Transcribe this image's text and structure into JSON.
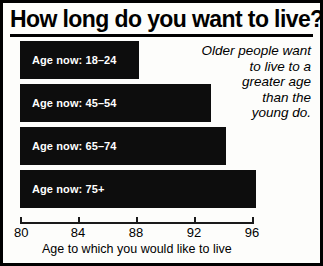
{
  "chart_data": {
    "type": "bar",
    "orientation": "horizontal",
    "title": "How long do you want to live?",
    "xlabel": "Age to which you would like to live",
    "ylabel": "",
    "categories": [
      "Age now: 18–24",
      "Age now: 45–54",
      "Age now: 65–74",
      "Age now: 75+"
    ],
    "values": [
      88.2,
      93.2,
      94.2,
      96.3
    ],
    "xlim": [
      80,
      96.5
    ],
    "xticks": [
      80,
      84,
      88,
      92,
      96
    ],
    "xtick_labels": [
      "80",
      "84",
      "88",
      "92",
      "96"
    ],
    "grid": false,
    "legend": false,
    "annotations": [
      {
        "text": "Older people want to live to a greater age than the young do.",
        "lines": [
          "Older people want",
          "to live to a",
          "greater age",
          "than the",
          "young do."
        ],
        "align": "right",
        "style": "italic"
      }
    ],
    "colors": {
      "bar": "#0d0d0d",
      "bar_label_text": "#ffffff",
      "background": "#fdfdfb",
      "axis": "#1a1a1a",
      "border": "#000000"
    }
  }
}
